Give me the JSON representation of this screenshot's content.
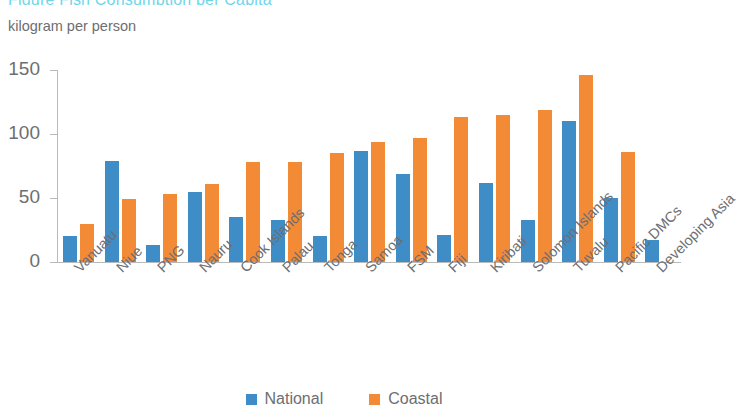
{
  "header": {
    "cut_off_title": "Figure  Fish Consumption per Capita",
    "axis_unit": "kilogram per person"
  },
  "colors": {
    "national": "#3e8dc6",
    "coastal": "#f28a36",
    "axis": "#b9babc",
    "text": "#6d6e71",
    "title_accent": "#6fd6ea"
  },
  "legend": {
    "items": [
      {
        "label": "National",
        "color": "#3e8dc6"
      },
      {
        "label": "Coastal",
        "color": "#f28a36"
      }
    ]
  },
  "chart_data": {
    "type": "bar",
    "title": "",
    "subtitle": "kilogram per person",
    "xlabel": "",
    "ylabel": "kilogram per person",
    "ylim": [
      0,
      150
    ],
    "yticks": [
      0,
      50,
      100,
      150
    ],
    "ytick_labels": [
      "0",
      "50",
      "100",
      "150"
    ],
    "grid": false,
    "legend_position": "bottom-center",
    "categories": [
      "Vanuatu",
      "Niue",
      "PNG",
      "Nauru",
      "Cook Islands",
      "Palau",
      "Tonga",
      "Samoa",
      "FSM",
      "Fiji",
      "Kiribati",
      "Solomon Islands",
      "Tuvalu",
      "Pacific DMCs",
      "Developing Asia"
    ],
    "series": [
      {
        "name": "National",
        "color": "#3e8dc6",
        "values": [
          20,
          79,
          13,
          55,
          35,
          33,
          20,
          87,
          69,
          21,
          62,
          33,
          110,
          50,
          17
        ]
      },
      {
        "name": "Coastal",
        "color": "#f28a36",
        "values": [
          30,
          49,
          53,
          61,
          78,
          78,
          85,
          94,
          97,
          113,
          115,
          119,
          146,
          86,
          null
        ]
      }
    ]
  }
}
